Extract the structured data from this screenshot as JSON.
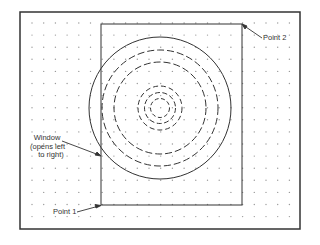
{
  "diagram": {
    "type": "window-selection-illustration",
    "labels": {
      "point2": "Point 2",
      "point1": "Point 1",
      "window_line1": "Window",
      "window_line2": "(opens left",
      "window_line3": "to right)"
    },
    "colors": {
      "line": "#333333",
      "dot": "#999999",
      "background": "#ffffff"
    }
  }
}
